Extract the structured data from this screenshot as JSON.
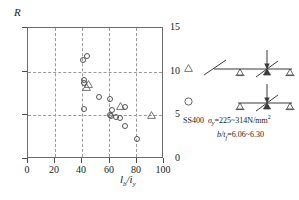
{
  "chart_data": {
    "type": "scatter",
    "title": "",
    "xlabel": "lb/iy",
    "ylabel": "R",
    "xlim": [
      0,
      100
    ],
    "ylim": [
      0,
      15
    ],
    "xticks": [
      "0",
      "20",
      "40",
      "60",
      "80",
      "100"
    ],
    "yticks": [
      "0",
      "5",
      "10",
      "15"
    ],
    "grid": "dashed gridlines at x=20,40,60,80 and y=5,10",
    "legend_position": "right",
    "series": [
      {
        "name": "circle",
        "marker": "open-circle",
        "points": [
          {
            "x": 40.5,
            "y": 11.3
          },
          {
            "x": 43.5,
            "y": 11.8
          },
          {
            "x": 41.0,
            "y": 9.0
          },
          {
            "x": 41.5,
            "y": 8.7
          },
          {
            "x": 52.0,
            "y": 7.1
          },
          {
            "x": 60.5,
            "y": 6.9
          },
          {
            "x": 41.0,
            "y": 5.7
          },
          {
            "x": 62.0,
            "y": 5.6
          },
          {
            "x": 71.0,
            "y": 5.9
          },
          {
            "x": 60.5,
            "y": 5.0
          },
          {
            "x": 61.0,
            "y": 4.9
          },
          {
            "x": 64.5,
            "y": 4.8
          },
          {
            "x": 67.5,
            "y": 4.7
          },
          {
            "x": 71.5,
            "y": 3.8
          },
          {
            "x": 80.0,
            "y": 2.3
          }
        ]
      },
      {
        "name": "triangle",
        "marker": "open-triangle",
        "points": [
          {
            "x": 44.0,
            "y": 9.3
          },
          {
            "x": 43.0,
            "y": 8.9
          },
          {
            "x": 67.5,
            "y": 6.8
          },
          {
            "x": 90.5,
            "y": 5.7
          }
        ]
      }
    ]
  },
  "axes": {
    "y_label": "R",
    "x_label_main": "l",
    "x_label_sub1": "b",
    "x_label_slash": "/i",
    "x_label_sub2": "y",
    "yticks": [
      {
        "value": 15,
        "label": "15"
      },
      {
        "value": 10,
        "label": "10"
      },
      {
        "value": 5,
        "label": "5"
      },
      {
        "value": 0,
        "label": "0"
      }
    ],
    "xticks": [
      {
        "value": 0,
        "label": "0"
      },
      {
        "value": 20,
        "label": "20"
      },
      {
        "value": 40,
        "label": "40"
      },
      {
        "value": 60,
        "label": "60"
      },
      {
        "value": 80,
        "label": "80"
      },
      {
        "value": 100,
        "label": "100"
      }
    ]
  },
  "legend": {
    "rows": [
      {
        "marker": "triangle",
        "diagram": "beam-cantilever-overhang-with-point-load"
      },
      {
        "marker": "circle",
        "diagram": "simply-supported-beam-with-central-point-load"
      }
    ],
    "caption": {
      "line1_material": "SS400",
      "line1_symbol": "σ",
      "line1_symbol_sub": "y",
      "line1_value": "=225~314N/mm",
      "line1_sup": "2",
      "line2_symbol": "b/t",
      "line2_symbol_sub": "f",
      "line2_value": "=6.06~6.30"
    }
  },
  "colors": {
    "axis": "#4a4a4a",
    "frame": "#6b6b6b",
    "grid": "#9a9a9a",
    "marker": "#545454",
    "text": "#1a1a1a"
  }
}
